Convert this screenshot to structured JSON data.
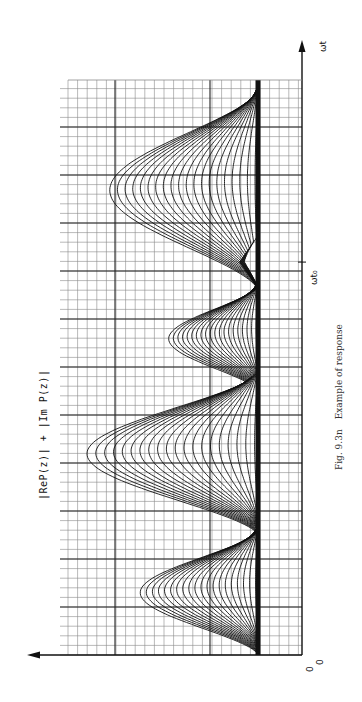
{
  "figure": {
    "caption_number": "Fig. 9.3n",
    "caption_text": "Example of response",
    "y_axis_label": "|ReP(z)| + |Im P(z)|",
    "x_axis_label": "ωt",
    "origin_label": "0",
    "origin_label_2": "0",
    "marker_label": "ωt₀",
    "orientation": "rotated 90° counter-clockwise (ωt axis runs upward)"
  },
  "colors": {
    "ink": "#111111",
    "grid_minor": "#8a8a8a",
    "grid_major": "#222222",
    "paper": "#ffffff"
  },
  "chart_data": {
    "type": "line",
    "title": "Example of response",
    "xlabel": "ωt",
    "ylabel": "|ReP(z)| + |Im P(z)|",
    "grid": true,
    "legend": "none",
    "annotations": [
      "ωt₀",
      "0",
      "0"
    ],
    "x_range": [
      0,
      12
    ],
    "y_range": [
      0,
      10
    ],
    "marker_x": 8.2,
    "lobes": [
      {
        "center": 1.3,
        "halfwidth": 1.3,
        "peak": 6.2
      },
      {
        "center": 4.2,
        "halfwidth": 1.7,
        "peak": 9.0
      },
      {
        "center": 6.6,
        "halfwidth": 1.1,
        "peak": 4.7
      },
      {
        "center": 9.7,
        "halfwidth": 2.1,
        "peak": 7.8
      }
    ],
    "cusp": {
      "center": 8.2,
      "halfwidth": 0.55,
      "peak": 1.0
    },
    "curve_count": 20,
    "curve_scale_min": 0.02,
    "curve_scale_max": 1.0
  }
}
